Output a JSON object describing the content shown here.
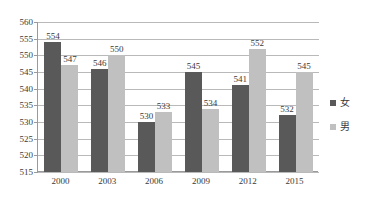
{
  "chart_data": {
    "type": "bar",
    "title": "",
    "subtitle": "",
    "xlabel": "",
    "ylabel": "",
    "categories": [
      "2000",
      "2003",
      "2006",
      "2009",
      "2012",
      "2015"
    ],
    "series": [
      {
        "name": "女",
        "color": "#595959",
        "values": [
          554,
          546,
          530,
          545,
          541,
          532
        ]
      },
      {
        "name": "男",
        "color": "#c0c0c0",
        "values": [
          547,
          550,
          533,
          534,
          552,
          545
        ]
      }
    ],
    "ylim": [
      515,
      560
    ],
    "ytick_step": 5,
    "yticks": [
      "560",
      "555",
      "550",
      "545",
      "540",
      "535",
      "530",
      "525",
      "520",
      "515"
    ],
    "grid": true,
    "legend_position": "right",
    "data_labels": true
  },
  "legend": {
    "items": [
      {
        "label": "女",
        "swatch": "female-swatch"
      },
      {
        "label": "男",
        "swatch": "male-swatch"
      }
    ]
  },
  "colors": {
    "female": "#595959",
    "male": "#c0c0c0",
    "gridline": "#b9b9b9",
    "axis": "#9a9a9a",
    "text": "#3a3a3a",
    "background": "#ffffff"
  }
}
